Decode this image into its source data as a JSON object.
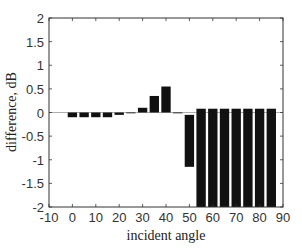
{
  "chart_data": {
    "type": "bar",
    "title": "",
    "xlabel": "incident angle",
    "ylabel": "difference, dB",
    "xlim": [
      -10,
      90
    ],
    "ylim": [
      -2,
      2
    ],
    "xticks": [
      -10,
      0,
      10,
      20,
      30,
      40,
      50,
      60,
      70,
      80,
      90
    ],
    "yticks": [
      2,
      1.5,
      1,
      0.5,
      0,
      -0.5,
      -1,
      -1.5,
      -2
    ],
    "ytick_labels": [
      "2",
      "1.5",
      "1",
      "0.5",
      "0",
      "-0.5",
      "-1",
      "-1.5",
      "-2"
    ],
    "grid": false,
    "legend": null,
    "bar_color": "#111111",
    "zero_line_color": "#999999",
    "x": [
      0,
      5,
      10,
      15,
      20,
      25,
      30,
      35,
      40,
      45,
      50,
      55,
      60,
      65,
      70,
      75,
      80,
      85
    ],
    "values": [
      -0.1,
      -0.1,
      -0.1,
      -0.1,
      -0.05,
      0.0,
      0.1,
      0.35,
      0.55,
      0.0,
      -1.15,
      -2.0,
      -2.0,
      -2.0,
      -2.0,
      -2.0,
      -2.0,
      -2.0
    ],
    "bar_spans": [
      [
        0.0,
        -0.1
      ],
      [
        0.0,
        -0.1
      ],
      [
        0.0,
        -0.1
      ],
      [
        0.0,
        -0.1
      ],
      [
        0.0,
        -0.05
      ],
      [
        0.0,
        0.0
      ],
      [
        0.0,
        0.1
      ],
      [
        0.0,
        0.35
      ],
      [
        0.0,
        0.55
      ],
      [
        0.0,
        0.0
      ],
      [
        -0.05,
        -1.15
      ],
      [
        0.08,
        -2.0
      ],
      [
        0.08,
        -2.0
      ],
      [
        0.08,
        -2.0
      ],
      [
        0.08,
        -2.0
      ],
      [
        0.08,
        -2.0
      ],
      [
        0.08,
        -2.0
      ],
      [
        0.08,
        -2.0
      ]
    ],
    "note": "bars from 55 to 85 degrees are clipped at the -2 axis limit"
  }
}
